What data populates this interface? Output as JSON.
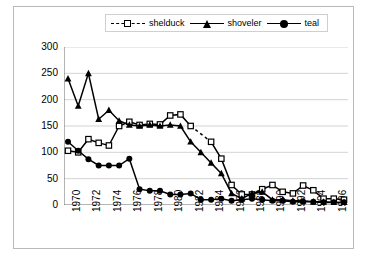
{
  "chart_data": {
    "type": "line",
    "title": "",
    "xlabel": "",
    "ylabel": "number of breeding individuals",
    "xlim": [
      1970,
      1997
    ],
    "ylim": [
      0,
      300
    ],
    "ytick_step": 50,
    "yticks": [
      0,
      50,
      100,
      150,
      200,
      250,
      300
    ],
    "xticks": [
      1970,
      1972,
      1974,
      1976,
      1978,
      1980,
      1982,
      1984,
      1986,
      1988,
      1990,
      1992,
      1994,
      1996
    ],
    "x_tick_interval": 2,
    "x": [
      1970,
      1971,
      1972,
      1973,
      1974,
      1975,
      1976,
      1977,
      1978,
      1979,
      1980,
      1981,
      1982,
      1983,
      1984,
      1985,
      1986,
      1987,
      1988,
      1989,
      1990,
      1991,
      1992,
      1993,
      1994,
      1995,
      1996,
      1997
    ],
    "grid": "horizontal",
    "legend_position": "top-center",
    "series": [
      {
        "name": "shelduck",
        "marker": "open-square",
        "line_style": "dashed",
        "color": "#000000",
        "values": [
          103,
          100,
          125,
          118,
          113,
          150,
          158,
          152,
          154,
          153,
          170,
          172,
          150,
          null,
          120,
          88,
          38,
          20,
          20,
          30,
          38,
          25,
          22,
          37,
          28,
          12,
          12,
          10
        ]
      },
      {
        "name": "shoveler",
        "marker": "filled-triangle",
        "line_style": "solid",
        "color": "#000000",
        "values": [
          240,
          188,
          250,
          163,
          180,
          160,
          152,
          150,
          152,
          150,
          152,
          150,
          120,
          100,
          80,
          60,
          22,
          12,
          22,
          25,
          10,
          10,
          8,
          8,
          6,
          6,
          5,
          5
        ]
      },
      {
        "name": "teal",
        "marker": "filled-circle",
        "line_style": "solid",
        "color": "#000000",
        "values": [
          120,
          103,
          87,
          75,
          75,
          75,
          88,
          30,
          27,
          27,
          20,
          20,
          22,
          10,
          10,
          12,
          8,
          10,
          12,
          10,
          8,
          8,
          6,
          6,
          6,
          5,
          5,
          5
        ]
      }
    ]
  },
  "legend": {
    "items": [
      {
        "label": "shelduck",
        "marker": "open-square",
        "style": "dashed"
      },
      {
        "label": "shoveler",
        "marker": "filled-triangle",
        "style": "solid"
      },
      {
        "label": "teal",
        "marker": "filled-circle",
        "style": "solid"
      }
    ]
  }
}
